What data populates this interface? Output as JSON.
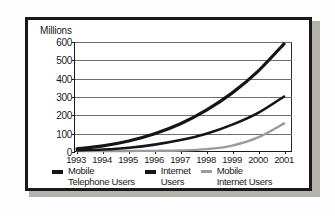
{
  "chart_data": {
    "type": "line",
    "title": "",
    "ylabel": "Millions",
    "xlabel": "",
    "grid": true,
    "legend_position": "bottom",
    "ylim": [
      0,
      600
    ],
    "yticks": [
      0,
      100,
      200,
      300,
      400,
      500,
      600
    ],
    "ytick_labels": [
      "0",
      "100",
      "200",
      "300",
      "400",
      "500",
      "600"
    ],
    "categories": [
      "1993",
      "1994",
      "1995",
      "1996",
      "1997",
      "1998",
      "1999",
      "2000",
      "2001"
    ],
    "x": [
      1993,
      1994,
      1995,
      1996,
      1997,
      1998,
      1999,
      2000,
      2001
    ],
    "series": [
      {
        "name": "Mobile Telephone Users",
        "color": "#151515",
        "line_width": 3.2,
        "values": [
          12,
          28,
          55,
          95,
          150,
          225,
          320,
          440,
          590
        ]
      },
      {
        "name": "Internet Users",
        "color": "#151515",
        "line_width": 2.6,
        "values": [
          3,
          8,
          18,
          35,
          60,
          95,
          145,
          210,
          300
        ]
      },
      {
        "name": "Mobile Internet Users",
        "color": "#9a9a9a",
        "line_width": 2.4,
        "values": [
          0,
          0,
          0,
          1,
          3,
          10,
          30,
          75,
          152
        ]
      }
    ]
  },
  "legend": {
    "items": [
      {
        "label_line1": "Mobile",
        "label_line2": "Telephone Users",
        "color": "#151515",
        "thickness": 4
      },
      {
        "label_line1": "Internet",
        "label_line2": "Users",
        "color": "#151515",
        "thickness": 4
      },
      {
        "label_line1": "Mobile",
        "label_line2": "Internet Users",
        "color": "#9a9a9a",
        "thickness": 3
      }
    ]
  }
}
